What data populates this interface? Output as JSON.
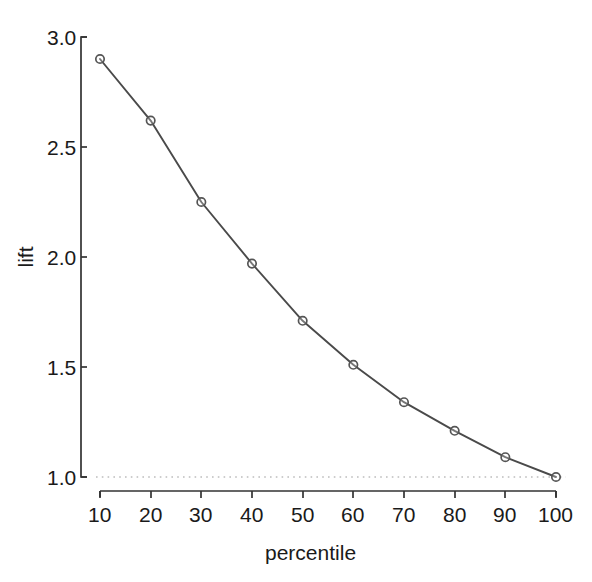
{
  "chart_data": {
    "type": "line",
    "title": "",
    "xlabel": "percentile",
    "ylabel": "lift",
    "x": [
      10,
      20,
      30,
      40,
      50,
      60,
      70,
      80,
      90,
      100
    ],
    "values": [
      2.9,
      2.62,
      2.25,
      1.97,
      1.71,
      1.51,
      1.34,
      1.21,
      1.09,
      1.0
    ],
    "series": [
      {
        "name": "lift",
        "values": [
          2.9,
          2.62,
          2.25,
          1.97,
          1.71,
          1.51,
          1.34,
          1.21,
          1.09,
          1.0
        ]
      }
    ],
    "xlim": [
      10,
      100
    ],
    "ylim": [
      1.0,
      3.0
    ],
    "xticks": [
      10,
      20,
      30,
      40,
      50,
      60,
      70,
      80,
      90,
      100
    ],
    "xtick_labels": [
      "10",
      "20",
      "30",
      "40",
      "50",
      "60",
      "70",
      "80",
      "90",
      "100"
    ],
    "yticks": [
      1.0,
      1.5,
      2.0,
      2.5,
      3.0
    ],
    "ytick_labels": [
      "1.0",
      "1.5",
      "2.0",
      "2.5",
      "3.0"
    ],
    "grid": false,
    "legend": false,
    "legend_position": "none",
    "annotations": [
      {
        "name": "baseline-reference",
        "type": "horizontal-dotted-line",
        "y": 1.0,
        "label": ""
      }
    ],
    "marker": "open-circle",
    "line_color": "#4a4a4a",
    "marker_color": "#555555",
    "reference_line_color": "#bdbdbd",
    "axis_color": "#333333",
    "background_color": "#ffffff"
  }
}
